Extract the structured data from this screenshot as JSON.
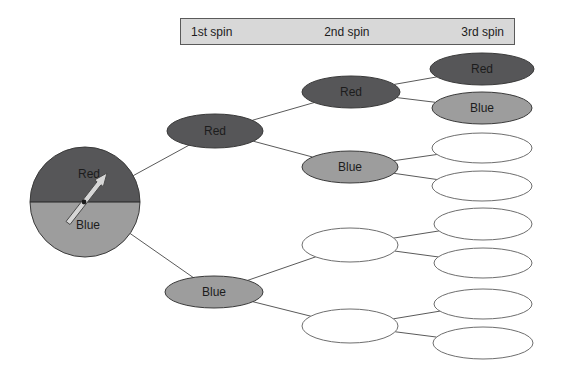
{
  "header": {
    "labels": [
      "1st spin",
      "2nd spin",
      "3rd spin"
    ]
  },
  "spinner": {
    "sections": [
      {
        "label": "Red"
      },
      {
        "label": "Blue"
      }
    ]
  },
  "nodes": [
    {
      "id": "s1-red",
      "column": "1st spin",
      "label": "Red",
      "variant": "red"
    },
    {
      "id": "s1-blue",
      "column": "1st spin",
      "label": "Blue",
      "variant": "blue"
    },
    {
      "id": "s2-red",
      "column": "2nd spin",
      "label": "Red",
      "variant": "red"
    },
    {
      "id": "s2-blue",
      "column": "2nd spin",
      "label": "Blue",
      "variant": "blue"
    },
    {
      "id": "s2-e1",
      "column": "2nd spin",
      "label": "",
      "variant": "empty"
    },
    {
      "id": "s2-e2",
      "column": "2nd spin",
      "label": "",
      "variant": "empty"
    },
    {
      "id": "s3-red",
      "column": "3rd spin",
      "label": "Red",
      "variant": "red"
    },
    {
      "id": "s3-blue",
      "column": "3rd spin",
      "label": "Blue",
      "variant": "blue"
    },
    {
      "id": "s3-e1",
      "column": "3rd spin",
      "label": "",
      "variant": "empty"
    },
    {
      "id": "s3-e2",
      "column": "3rd spin",
      "label": "",
      "variant": "empty"
    },
    {
      "id": "s3-e3",
      "column": "3rd spin",
      "label": "",
      "variant": "empty"
    },
    {
      "id": "s3-e4",
      "column": "3rd spin",
      "label": "",
      "variant": "empty"
    },
    {
      "id": "s3-e5",
      "column": "3rd spin",
      "label": "",
      "variant": "empty"
    },
    {
      "id": "s3-e6",
      "column": "3rd spin",
      "label": "",
      "variant": "empty"
    }
  ],
  "edges": [
    [
      "spinner",
      "s1-red"
    ],
    [
      "spinner",
      "s1-blue"
    ],
    [
      "s1-red",
      "s2-red"
    ],
    [
      "s1-red",
      "s2-blue"
    ],
    [
      "s1-blue",
      "s2-e1"
    ],
    [
      "s1-blue",
      "s2-e2"
    ],
    [
      "s2-red",
      "s3-red"
    ],
    [
      "s2-red",
      "s3-blue"
    ],
    [
      "s2-blue",
      "s3-e1"
    ],
    [
      "s2-blue",
      "s3-e2"
    ],
    [
      "s2-e1",
      "s3-e3"
    ],
    [
      "s2-e1",
      "s3-e4"
    ],
    [
      "s2-e2",
      "s3-e5"
    ],
    [
      "s2-e2",
      "s3-e6"
    ]
  ],
  "colors": {
    "red_fill": "#565658",
    "blue_fill": "#9d9d9d",
    "empty_fill": "#ffffff",
    "node_outline": "#3a3a3a",
    "empty_outline": "#6e6e6e",
    "edge_line": "#5a5a5a",
    "header_fill": "#d8d8d8",
    "header_border": "#5a5a5a",
    "text": "#1c1c1c",
    "arrow_fill": "#d6d6d6",
    "arrow_outline": "#4a4a4a",
    "divider": "#222222"
  }
}
